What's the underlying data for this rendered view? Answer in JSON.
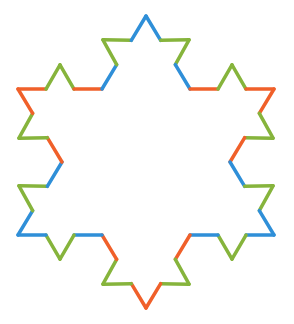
{
  "figure": {
    "kind": "koch-snowflake",
    "level": 2,
    "center": [
      146,
      162
    ],
    "stroke_width": 3.5,
    "colors": {
      "blue": "#2f8fd8",
      "orange": "#f0602a",
      "green": "#86b43c"
    },
    "level1_vertices": [
      [
        146,
        16
      ],
      [
        190,
        89
      ],
      [
        274,
        89
      ],
      [
        230,
        162
      ],
      [
        274,
        235
      ],
      [
        190,
        235
      ],
      [
        146,
        308
      ],
      [
        102,
        235
      ],
      [
        18,
        235
      ],
      [
        62,
        162
      ],
      [
        18,
        89
      ],
      [
        102,
        89
      ]
    ],
    "edge_outer_colors": [
      "blue",
      "orange",
      "orange",
      "blue",
      "blue",
      "orange",
      "orange",
      "blue",
      "blue",
      "orange",
      "orange",
      "blue"
    ],
    "edge_middle_color": "green"
  }
}
